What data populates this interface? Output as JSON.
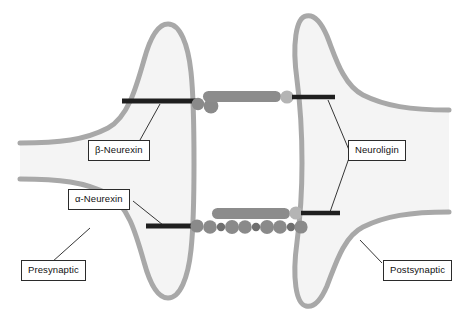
{
  "figure": {
    "type": "biological-schematic",
    "canvas": {
      "width": 466,
      "height": 321,
      "background": "#ffffff"
    },
    "colors": {
      "membrane_stroke": "#a8a8a8",
      "cytoplasm_fill": "#f4f4f4",
      "rod_gray": "#8c8c8c",
      "bar_dark": "#1f1f1f",
      "circle_large": "#8a8a8a",
      "circle_small": "#6f6f6f",
      "circle_light": "#b4b4b4",
      "label_border": "#2b2b2b",
      "label_text": "#111111",
      "leader_line": "#1f1f1f"
    }
  },
  "labels": {
    "beta_neurexin": "β-Neurexin",
    "alpha_neurexin": "α-Neurexin",
    "neuroligin": "Neuroligin",
    "presynaptic": "Presynaptic",
    "postsynaptic": "Postsynaptic"
  },
  "compartments": {
    "presynaptic": {
      "name": "Presynaptic terminal",
      "side": "left",
      "membrane_x": 190
    },
    "postsynaptic": {
      "name": "Postsynaptic terminal",
      "side": "right",
      "membrane_x": 300
    },
    "synaptic_cleft": {
      "name": "Synaptic cleft",
      "x_start": 190,
      "x_end": 300
    }
  },
  "complexes": [
    {
      "id": "upper",
      "name": "beta-neurexin-neuroligin complex",
      "y": 101,
      "presynaptic_bar": {
        "x1": 122,
        "x2": 196,
        "label_ref": "beta_neurexin"
      },
      "neurexin_domains": 2,
      "neurexin_domain_color": "#8a8a8a",
      "bridging_rod": {
        "x1": 203,
        "x2": 281,
        "color": "#8c8c8c"
      },
      "neuroligin_head": {
        "cx": 288,
        "color": "#b4b4b4"
      },
      "postsynaptic_bar": {
        "x1": 292,
        "x2": 334,
        "label_ref": "neuroligin"
      }
    },
    {
      "id": "lower",
      "name": "alpha-neurexin-neuroligin complex",
      "y": 226,
      "presynaptic_bar": {
        "x1": 146,
        "x2": 196,
        "label_ref": "alpha_neurexin"
      },
      "bead_chain_count": 13,
      "bead_chain_pattern": "alternating large and small LNS/EGF domains",
      "bridging_rod": {
        "x1": 210,
        "x2": 288,
        "y": 213,
        "color": "#8c8c8c"
      },
      "neuroligin_head": {
        "cx": 292,
        "y": 213,
        "color": "#b4b4b4"
      },
      "postsynaptic_bar": {
        "x1": 297,
        "x2": 336,
        "y": 213,
        "label_ref": "neuroligin"
      }
    }
  ],
  "leader_lines": [
    {
      "from": "beta_neurexin_label",
      "to": "upper_presynaptic_bar"
    },
    {
      "from": "alpha_neurexin_label",
      "to": "lower_presynaptic_bar"
    },
    {
      "from": "neuroligin_label",
      "to": "upper_postsynaptic_bar"
    },
    {
      "from": "neuroligin_label",
      "to": "lower_postsynaptic_bar"
    },
    {
      "from": "presynaptic_label",
      "to": "presynaptic_membrane"
    },
    {
      "from": "postsynaptic_label",
      "to": "postsynaptic_membrane"
    }
  ]
}
